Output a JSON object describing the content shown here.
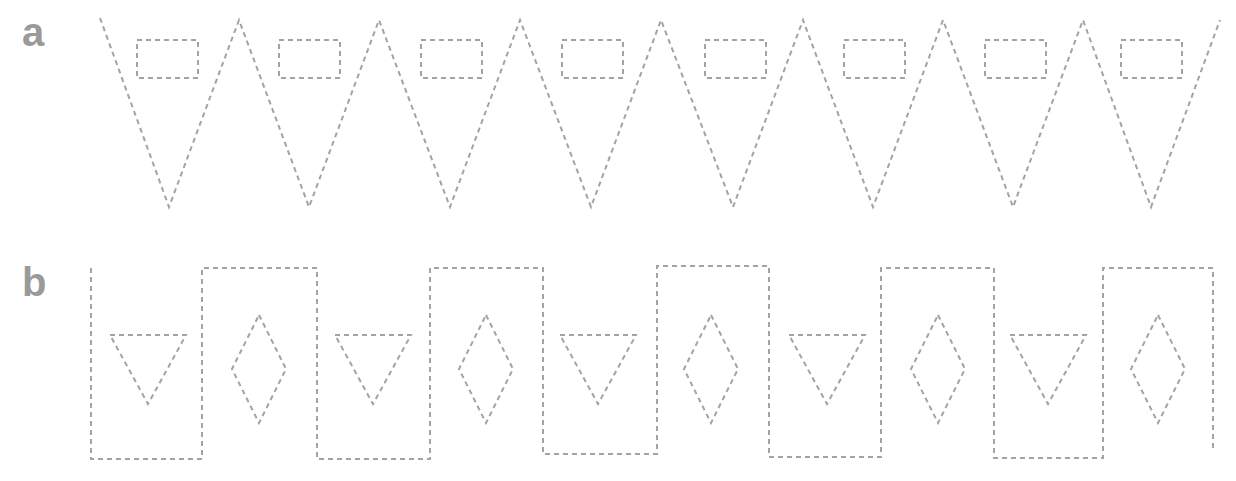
{
  "panels": [
    {
      "label": "a",
      "label_pos": [
        22,
        12
      ],
      "description": "Zigzag of downward triangles (dashed) each containing a small dashed rectangle near the top",
      "zigzag_points": [
        [
          100,
          18
        ],
        [
          169,
          207
        ],
        [
          239,
          20
        ],
        [
          309,
          207
        ],
        [
          379,
          20
        ],
        [
          450,
          207
        ],
        [
          520,
          20
        ],
        [
          591,
          207
        ],
        [
          661,
          20
        ],
        [
          733,
          207
        ],
        [
          803,
          20
        ],
        [
          873,
          207
        ],
        [
          943,
          20
        ],
        [
          1013,
          207
        ],
        [
          1083,
          20
        ],
        [
          1151,
          207
        ],
        [
          1220,
          20
        ]
      ],
      "rects": [
        {
          "x": 137,
          "y": 40,
          "w": 61,
          "h": 38
        },
        {
          "x": 279,
          "y": 40,
          "w": 61,
          "h": 38
        },
        {
          "x": 421,
          "y": 40,
          "w": 61,
          "h": 38
        },
        {
          "x": 562,
          "y": 40,
          "w": 61,
          "h": 38
        },
        {
          "x": 705,
          "y": 40,
          "w": 61,
          "h": 38
        },
        {
          "x": 844,
          "y": 40,
          "w": 61,
          "h": 38
        },
        {
          "x": 985,
          "y": 40,
          "w": 61,
          "h": 38
        },
        {
          "x": 1121,
          "y": 40,
          "w": 61,
          "h": 38
        }
      ]
    },
    {
      "label": "b",
      "label_pos": [
        22,
        262
      ],
      "description": "Square-wave of alternating dashed rectangles; low cells contain a downward triangle, high cells contain a diamond",
      "wave_points": [
        [
          91,
          268
        ],
        [
          91,
          459
        ],
        [
          202,
          459
        ],
        [
          202,
          268
        ],
        [
          317,
          268
        ],
        [
          317,
          459
        ],
        [
          430,
          459
        ],
        [
          430,
          268
        ],
        [
          543,
          268
        ],
        [
          543,
          454
        ],
        [
          657,
          454
        ],
        [
          657,
          266
        ],
        [
          769,
          266
        ],
        [
          769,
          457
        ],
        [
          881,
          457
        ],
        [
          881,
          268
        ],
        [
          994,
          268
        ],
        [
          994,
          458
        ],
        [
          1103,
          458
        ],
        [
          1103,
          268
        ],
        [
          1213,
          268
        ],
        [
          1213,
          452
        ]
      ],
      "triangles": [
        {
          "cx": 148,
          "top": 335,
          "half_w": 38,
          "bottom": 404
        },
        {
          "cx": 373,
          "top": 335,
          "half_w": 38,
          "bottom": 404
        },
        {
          "cx": 598,
          "top": 335,
          "half_w": 38,
          "bottom": 404
        },
        {
          "cx": 827,
          "top": 335,
          "half_w": 38,
          "bottom": 404
        },
        {
          "cx": 1048,
          "top": 335,
          "half_w": 38,
          "bottom": 404
        }
      ],
      "diamonds": [
        {
          "cx": 259,
          "cy": 369,
          "rx": 27,
          "ry": 54
        },
        {
          "cx": 486,
          "cy": 369,
          "rx": 27,
          "ry": 54
        },
        {
          "cx": 711,
          "cy": 369,
          "rx": 27,
          "ry": 54
        },
        {
          "cx": 938,
          "cy": 369,
          "rx": 27,
          "ry": 54
        },
        {
          "cx": 1158,
          "cy": 369,
          "rx": 27,
          "ry": 54
        }
      ]
    }
  ],
  "colors": {
    "stroke": "#a3a3a3",
    "label": "#9a9a9a",
    "background": "#ffffff"
  }
}
